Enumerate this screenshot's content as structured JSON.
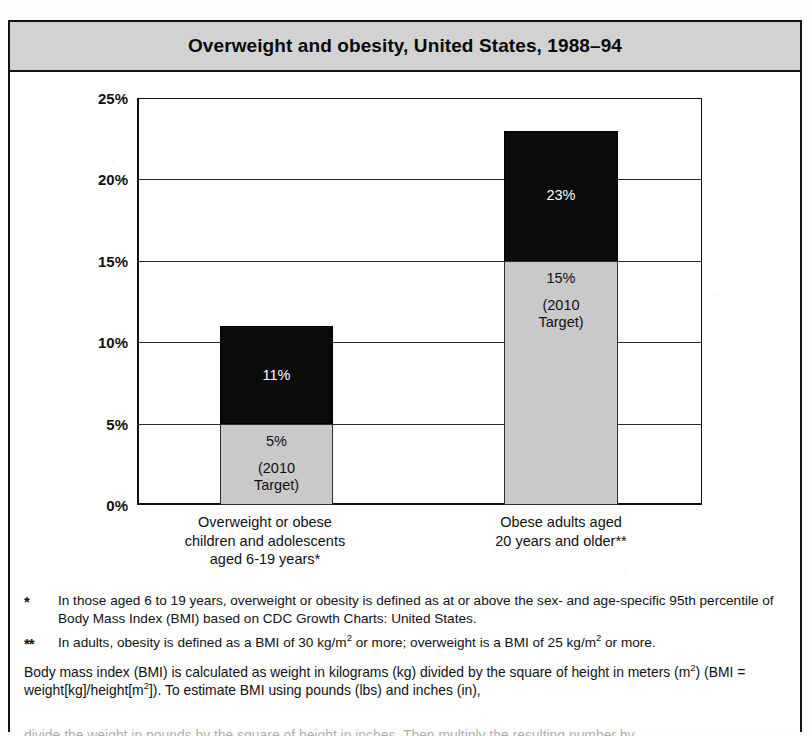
{
  "figure": {
    "title": "Overweight and obesity, United States, 1988–94"
  },
  "chart_data": {
    "type": "bar",
    "title": "Overweight and obesity, United States, 1988–94",
    "xlabel": "",
    "ylabel": "",
    "ylim": [
      0,
      25
    ],
    "grid": true,
    "legend": "none",
    "stacked_overlay": true,
    "ytick_labels": [
      "0%",
      "5%",
      "10%",
      "15%",
      "20%",
      "25%"
    ],
    "ytick_values": [
      0,
      5,
      10,
      15,
      20,
      25
    ],
    "categories": [
      "Overweight or obese children and adolescents aged 6-19 years*",
      "Obese adults aged 20 years and older**"
    ],
    "category_lines": [
      [
        "Overweight or obese",
        "children and adolescents",
        "aged 6-19 years*"
      ],
      [
        "Obese adults aged",
        "20 years and older**"
      ]
    ],
    "series": [
      {
        "name": "Current prevalence",
        "color": "#0b0b0b",
        "values": [
          11,
          23
        ],
        "labels": [
          "11%",
          "23%"
        ]
      },
      {
        "name": "2010 Target",
        "color": "#c9c9c9",
        "values": [
          5,
          15
        ],
        "labels": [
          "5%",
          "15%"
        ],
        "note_lines": [
          "(2010",
          "Target)"
        ]
      }
    ],
    "bars": [
      {
        "category_index": 0,
        "actual_value": 11,
        "actual_label": "11%",
        "target_value": 5,
        "target_label": "5%",
        "target_note_line1": "(2010",
        "target_note_line2": "Target)"
      },
      {
        "category_index": 1,
        "actual_value": 23,
        "actual_label": "23%",
        "target_value": 15,
        "target_label": "15%",
        "target_note_line1": "(2010",
        "target_note_line2": "Target)"
      }
    ]
  },
  "notes": {
    "note1_marker": "*",
    "note1_text": "In those aged 6 to 19 years, overweight or obesity is defined as at or above the sex- and age-specific 95th percentile of Body Mass Index (BMI) based on CDC Growth Charts: United States.",
    "note2_marker": "**",
    "note2_text_a": "In adults, obesity is defined as a BMI of 30 kg/m",
    "note2_sup_a": "2",
    "note2_text_b": " or more; overweight is a BMI of 25 kg/m",
    "note2_sup_b": "2",
    "note2_text_c": " or more.",
    "paragraph_a": "Body mass index (BMI) is calculated as weight in kilograms (kg) divided by the square of height in meters (m",
    "paragraph_sup_a": "2",
    "paragraph_b": ") (BMI = weight[kg]/height[m",
    "paragraph_sup_b": "2",
    "paragraph_c": "]). To estimate BMI using pounds (lbs) and inches (in),",
    "paragraph_clipped": "divide the weight in pounds by the square of height in inches. Then multiply the resulting number by"
  }
}
